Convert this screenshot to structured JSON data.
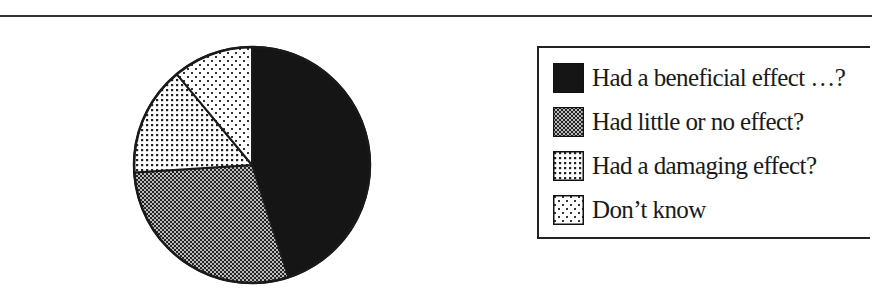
{
  "chart_data": {
    "type": "pie",
    "title": "",
    "categories": [
      "Had a beneficial effect …?",
      "Had little or no effect?",
      "Had a damaging effect?",
      "Don’t know"
    ],
    "values": [
      45,
      29,
      15,
      11
    ],
    "unit": "percent (estimated from slice angles)",
    "start_angle": "12 o'clock, clockwise",
    "legend_position": "right",
    "fills": [
      "solid-black",
      "dense-checker",
      "medium-dots",
      "sparse-dots"
    ]
  },
  "legend": {
    "items": [
      {
        "label": "Had a beneficial effect …?",
        "pattern": "solid-black"
      },
      {
        "label": "Had little or no effect?",
        "pattern": "dense-checker"
      },
      {
        "label": "Had a damaging effect?",
        "pattern": "medium-dots"
      },
      {
        "label": "Don’t know",
        "pattern": "sparse-dots"
      }
    ]
  },
  "colors": {
    "ink": "#1a1a1a",
    "background": "#ffffff"
  }
}
